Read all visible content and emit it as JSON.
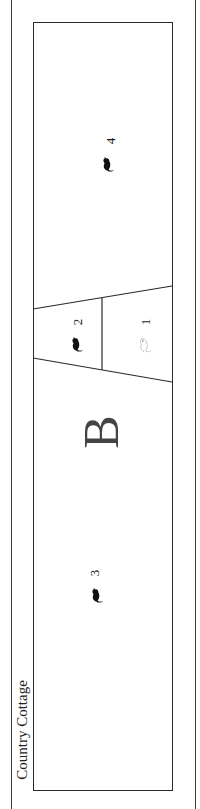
{
  "plan": {
    "title": "Country Cottage",
    "section_letter": "B",
    "colors": {
      "line": "#2a2a2a",
      "filled_icon": "#111111",
      "outline_icon": "#888888",
      "section_letter": "#444444"
    },
    "rooms": [
      {
        "number": "4",
        "icon": "rodent-filled-icon"
      },
      {
        "number": "2",
        "icon": "rodent-filled-icon"
      },
      {
        "number": "1",
        "icon": "rodent-outline-icon"
      },
      {
        "number": "3",
        "icon": "rodent-filled-icon"
      }
    ]
  }
}
